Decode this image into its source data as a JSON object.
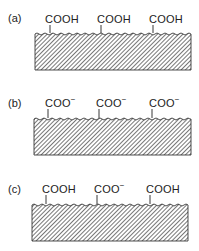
{
  "panels": [
    {
      "label": "(a)",
      "groups": [
        "COOH",
        "COOH",
        "COOH"
      ],
      "charges": [
        "",
        "",
        ""
      ]
    },
    {
      "label": "(b)",
      "groups": [
        "COO",
        "COO",
        "COO"
      ],
      "charges": [
        "−",
        "−",
        "−"
      ]
    },
    {
      "label": "(c)",
      "groups": [
        "COOH",
        "COO",
        "COOH"
      ],
      "charges": [
        "",
        "−",
        ""
      ]
    }
  ],
  "colors": {
    "ink": "#222222",
    "hatch": "#555555",
    "background": "#ffffff"
  }
}
